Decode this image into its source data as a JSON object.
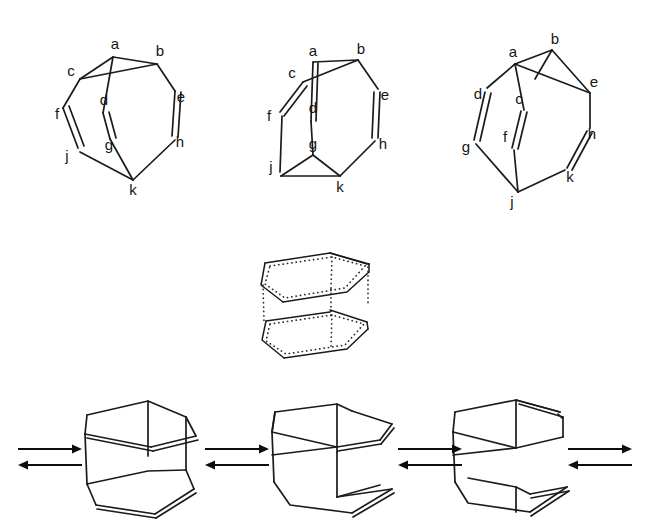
{
  "figure": {
    "background_color": "#ffffff",
    "line_color": "#1b1b1b",
    "label_color": "#151515",
    "width": 648,
    "height": 530,
    "caption": ""
  },
  "top_row": {
    "structures": [
      {
        "id": "conformer-1",
        "name": "labeled-ring-conformer-left",
        "vertex_labels": [
          "a",
          "b",
          "c",
          "d",
          "e",
          "f",
          "g",
          "h",
          "j",
          "k"
        ],
        "labels": {
          "a": {
            "text": "a",
            "x": 115,
            "y": 45
          },
          "b": {
            "text": "b",
            "x": 160,
            "y": 52
          },
          "c": {
            "text": "c",
            "x": 71,
            "y": 72
          },
          "d": {
            "text": "d",
            "x": 104,
            "y": 101
          },
          "e": {
            "text": "e",
            "x": 181,
            "y": 98
          },
          "f": {
            "text": "f",
            "x": 57,
            "y": 115
          },
          "g": {
            "text": "g",
            "x": 109,
            "y": 146
          },
          "h": {
            "text": "h",
            "x": 180,
            "y": 143
          },
          "j": {
            "text": "j",
            "x": 67,
            "y": 157
          },
          "k": {
            "text": "k",
            "x": 133,
            "y": 191
          }
        }
      },
      {
        "id": "conformer-2",
        "name": "labeled-ring-conformer-middle",
        "vertex_labels": [
          "a",
          "b",
          "c",
          "d",
          "e",
          "f",
          "g",
          "h",
          "j",
          "k"
        ],
        "labels": {
          "a": {
            "text": "a",
            "x": 313,
            "y": 52
          },
          "b": {
            "text": "b",
            "x": 361,
            "y": 50
          },
          "c": {
            "text": "c",
            "x": 292,
            "y": 74
          },
          "d": {
            "text": "d",
            "x": 313,
            "y": 109
          },
          "e": {
            "text": "e",
            "x": 385,
            "y": 96
          },
          "f": {
            "text": "f",
            "x": 269,
            "y": 117
          },
          "g": {
            "text": "g",
            "x": 313,
            "y": 145
          },
          "h": {
            "text": "h",
            "x": 383,
            "y": 145
          },
          "j": {
            "text": "j",
            "x": 271,
            "y": 168
          },
          "k": {
            "text": "k",
            "x": 340,
            "y": 188
          }
        }
      },
      {
        "id": "conformer-3",
        "name": "labeled-ring-conformer-right",
        "vertex_labels": [
          "a",
          "b",
          "c",
          "d",
          "e",
          "f",
          "g",
          "h",
          "j",
          "k"
        ],
        "labels": {
          "a": {
            "text": "a",
            "x": 513,
            "y": 53
          },
          "b": {
            "text": "b",
            "x": 555,
            "y": 40
          },
          "c": {
            "text": "c",
            "x": 519,
            "y": 100
          },
          "d": {
            "text": "d",
            "x": 478,
            "y": 95
          },
          "e": {
            "text": "e",
            "x": 594,
            "y": 83
          },
          "f": {
            "text": "f",
            "x": 505,
            "y": 138
          },
          "g": {
            "text": "g",
            "x": 466,
            "y": 148
          },
          "h": {
            "text": "h",
            "x": 592,
            "y": 135
          },
          "j": {
            "text": "j",
            "x": 512,
            "y": 203
          },
          "k": {
            "text": "k",
            "x": 570,
            "y": 178
          }
        }
      }
    ]
  },
  "middle_row": {
    "structure": {
      "id": "dotted-cage",
      "name": "dotted-outline-conformer",
      "style": "dotted",
      "description": "stacked half-chair cage drawn with dotted edges"
    }
  },
  "bottom_row": {
    "structures": [
      {
        "id": "tub-1",
        "name": "tub-conformer-left"
      },
      {
        "id": "tub-2",
        "name": "tub-conformer-middle"
      },
      {
        "id": "tub-3",
        "name": "tub-conformer-right"
      }
    ],
    "arrows": [
      {
        "id": "arrow-1",
        "name": "equilibrium-arrow-far-left",
        "kind": "equilibrium",
        "x": 18,
        "y": 455,
        "length": 62
      },
      {
        "id": "arrow-2",
        "name": "equilibrium-arrow-left",
        "kind": "equilibrium",
        "x": 205,
        "y": 455,
        "length": 62
      },
      {
        "id": "arrow-3",
        "name": "equilibrium-arrow-right",
        "kind": "equilibrium",
        "x": 410,
        "y": 455,
        "length": 62
      },
      {
        "id": "arrow-4",
        "name": "equilibrium-arrow-far-right",
        "kind": "equilibrium",
        "x": 568,
        "y": 455,
        "length": 62
      }
    ]
  }
}
